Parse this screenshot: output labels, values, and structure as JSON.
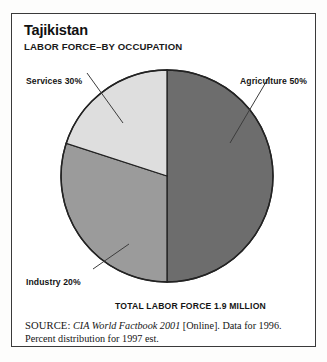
{
  "header": {
    "title": "Tajikistan",
    "subtitle": "LABOR FORCE–BY OCCUPATION"
  },
  "labels": {
    "services": "Services 30%",
    "agriculture": "Agriculture 50%",
    "industry": "Industry 20%",
    "total": "TOTAL LABOR FORCE 1.9 MILLION"
  },
  "source": {
    "label": "SOURCE:",
    "publication": "CIA World Factbook 2001",
    "rest": " [Online]. Data for 1996. Percent distribution for 1997 est."
  },
  "chart_data": {
    "type": "pie",
    "title": "Tajikistan",
    "subtitle": "LABOR FORCE–BY OCCUPATION",
    "categories": [
      "Agriculture",
      "Services",
      "Industry"
    ],
    "values": [
      50,
      30,
      20
    ],
    "value_unit": "percent",
    "labels": [
      "Agriculture 50%",
      "Services 30%",
      "Industry 20%"
    ],
    "colors": [
      "#6d6d6d",
      "#9b9b9b",
      "#dedede"
    ],
    "start_angle_deg": 0,
    "direction": "clockwise",
    "total_label": "TOTAL LABOR FORCE 1.9 MILLION",
    "total_value": 1.9,
    "total_unit": "million",
    "legend": "leader-line labels",
    "grid": false
  }
}
